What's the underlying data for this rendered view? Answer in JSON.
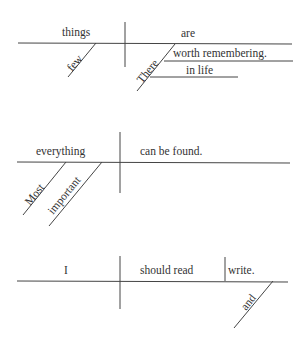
{
  "diagrams": [
    {
      "sentence": "There are few things worth remembering in life",
      "words": {
        "subject": "things",
        "verb": "are",
        "modifier_few": "few",
        "modifier_there": "There",
        "complement": "worth remembering.",
        "phrase": "in life"
      }
    },
    {
      "sentence": "Most important everything can be found.",
      "words": {
        "subject": "everything",
        "predicate": "can be found.",
        "modifier_most": "Most",
        "modifier_important": "important"
      }
    },
    {
      "sentence": "I should read and write.",
      "words": {
        "subject": "I",
        "verb1": "should read",
        "verb2": "write.",
        "conjunction": "and"
      }
    }
  ],
  "colors": {
    "line": "#444444",
    "text": "#333333",
    "background": "#ffffff"
  }
}
